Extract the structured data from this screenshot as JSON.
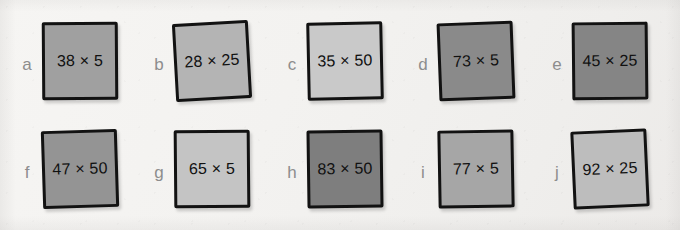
{
  "page": {
    "background_color": "#f4f3f1",
    "letter_color": "#8d8d8d",
    "ink_color": "#121212"
  },
  "items": [
    {
      "letter": "a",
      "expression": "38 × 5",
      "fill": "#a0a0a0",
      "left": 20,
      "row": 1
    },
    {
      "letter": "b",
      "expression": "28 × 25",
      "fill": "#b4b4b4",
      "left": 152,
      "row": 1
    },
    {
      "letter": "c",
      "expression": "35 × 50",
      "fill": "#c9c9c9",
      "left": 285,
      "row": 1
    },
    {
      "letter": "d",
      "expression": "73 × 5",
      "fill": "#8a8a8a",
      "left": 416,
      "row": 1
    },
    {
      "letter": "e",
      "expression": "45 × 25",
      "fill": "#858585",
      "left": 550,
      "row": 1
    },
    {
      "letter": "f",
      "expression": "47 × 50",
      "fill": "#949494",
      "left": 20,
      "row": 2
    },
    {
      "letter": "g",
      "expression": "65 × 5",
      "fill": "#c4c4c4",
      "left": 152,
      "row": 2
    },
    {
      "letter": "h",
      "expression": "83 × 50",
      "fill": "#7e7e7e",
      "left": 285,
      "row": 2
    },
    {
      "letter": "i",
      "expression": "77 × 5",
      "fill": "#a6a6a6",
      "left": 416,
      "row": 2
    },
    {
      "letter": "j",
      "expression": "92 × 25",
      "fill": "#bdbdbd",
      "left": 550,
      "row": 2
    }
  ]
}
